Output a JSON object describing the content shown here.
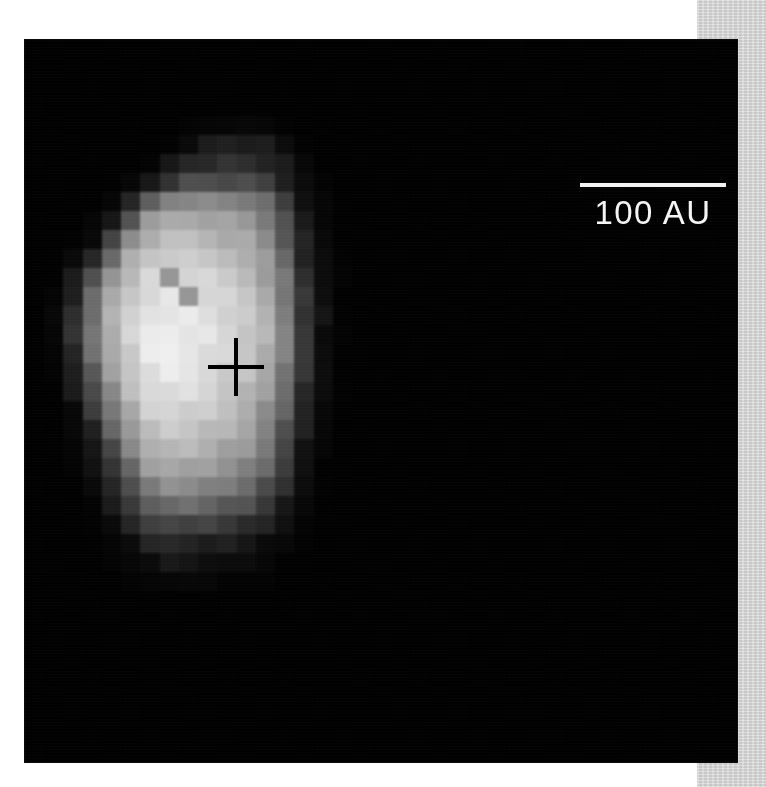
{
  "page": {
    "background_color": "#ffffff",
    "margin_strip_color": "#d4d4d4"
  },
  "image_panel": {
    "name": "astronomical-grayscale-image",
    "background_color": "#050505",
    "left": 25,
    "top": 40,
    "width": 712,
    "height": 722
  },
  "scale_bar": {
    "label": "100 AU",
    "value": 100,
    "unit": "AU",
    "line_color": "#f2f2f2",
    "text_color": "#f4f4f4",
    "line_length_px": 146
  },
  "position_marker": {
    "name": "source-position-cross",
    "color": "#000000",
    "center_x": 211,
    "center_y": 327,
    "arm_width_px": 56,
    "arm_height_px": 58
  },
  "chart_data": {
    "type": "heatmap",
    "title": "",
    "xlabel": "",
    "ylabel": "",
    "colormap": "grayscale",
    "vmin": 0,
    "vmax": 255,
    "cell_size_px": 19.2,
    "grid_cols": 37,
    "grid_rows": 38,
    "annotations": [
      {
        "kind": "scalebar",
        "text": "100 AU",
        "x": 626,
        "y": 185
      },
      {
        "kind": "cross",
        "text": "",
        "x": 211,
        "y": 327
      }
    ],
    "values": [
      [
        0,
        0,
        0,
        0,
        0,
        0,
        0,
        0,
        0,
        0,
        0,
        0,
        0,
        0,
        0,
        0,
        0,
        0,
        0,
        0,
        0,
        0,
        0,
        0,
        0,
        0,
        0,
        0,
        0,
        0,
        0,
        0,
        0,
        0,
        0,
        0,
        0
      ],
      [
        0,
        0,
        0,
        0,
        0,
        0,
        0,
        0,
        0,
        0,
        0,
        0,
        0,
        0,
        0,
        0,
        0,
        0,
        0,
        0,
        0,
        0,
        0,
        0,
        0,
        0,
        0,
        0,
        0,
        0,
        0,
        0,
        0,
        0,
        0,
        0,
        0
      ],
      [
        0,
        0,
        0,
        0,
        0,
        0,
        0,
        0,
        0,
        0,
        0,
        0,
        0,
        0,
        0,
        0,
        0,
        0,
        0,
        0,
        0,
        0,
        0,
        0,
        0,
        0,
        0,
        0,
        0,
        0,
        0,
        0,
        0,
        0,
        0,
        0,
        0
      ],
      [
        0,
        0,
        0,
        0,
        0,
        0,
        0,
        0,
        0,
        0,
        0,
        0,
        0,
        0,
        0,
        0,
        0,
        0,
        0,
        0,
        0,
        0,
        0,
        0,
        0,
        0,
        0,
        0,
        0,
        0,
        0,
        0,
        0,
        0,
        0,
        0,
        0
      ],
      [
        0,
        0,
        0,
        0,
        0,
        0,
        0,
        0,
        2,
        4,
        6,
        6,
        4,
        2,
        0,
        0,
        0,
        0,
        0,
        0,
        0,
        0,
        0,
        0,
        0,
        0,
        0,
        0,
        0,
        0,
        0,
        0,
        0,
        0,
        0,
        0,
        0
      ],
      [
        0,
        0,
        0,
        0,
        0,
        0,
        0,
        2,
        10,
        22,
        30,
        30,
        22,
        10,
        2,
        0,
        0,
        0,
        0,
        0,
        0,
        0,
        0,
        0,
        0,
        0,
        0,
        0,
        0,
        0,
        0,
        0,
        0,
        0,
        0,
        0,
        0
      ],
      [
        0,
        0,
        0,
        0,
        0,
        0,
        4,
        18,
        38,
        44,
        46,
        44,
        38,
        20,
        6,
        0,
        0,
        0,
        0,
        0,
        0,
        0,
        0,
        0,
        0,
        0,
        0,
        0,
        0,
        0,
        0,
        0,
        0,
        0,
        0,
        0,
        0
      ],
      [
        0,
        0,
        0,
        0,
        0,
        6,
        26,
        56,
        74,
        78,
        76,
        72,
        62,
        34,
        10,
        2,
        0,
        0,
        0,
        0,
        0,
        0,
        0,
        0,
        0,
        0,
        0,
        0,
        0,
        0,
        0,
        0,
        0,
        0,
        0,
        0,
        0
      ],
      [
        0,
        0,
        0,
        0,
        6,
        30,
        92,
        132,
        140,
        136,
        132,
        126,
        104,
        60,
        18,
        4,
        0,
        0,
        0,
        0,
        0,
        0,
        0,
        0,
        0,
        0,
        0,
        0,
        0,
        0,
        0,
        0,
        0,
        0,
        0,
        0,
        0
      ],
      [
        0,
        0,
        0,
        4,
        22,
        86,
        150,
        168,
        172,
        168,
        160,
        152,
        126,
        76,
        24,
        6,
        0,
        0,
        0,
        0,
        0,
        0,
        0,
        0,
        0,
        0,
        0,
        0,
        0,
        0,
        0,
        0,
        0,
        0,
        0,
        0,
        0
      ],
      [
        0,
        0,
        2,
        14,
        62,
        140,
        176,
        186,
        190,
        184,
        176,
        166,
        140,
        90,
        30,
        8,
        0,
        0,
        0,
        0,
        0,
        0,
        0,
        0,
        0,
        0,
        0,
        0,
        0,
        0,
        0,
        0,
        0,
        0,
        0,
        0,
        0
      ],
      [
        0,
        0,
        8,
        40,
        110,
        170,
        196,
        206,
        200,
        196,
        190,
        180,
        152,
        104,
        38,
        10,
        2,
        0,
        0,
        0,
        0,
        0,
        0,
        0,
        0,
        0,
        0,
        0,
        0,
        0,
        0,
        0,
        0,
        0,
        0,
        0,
        0
      ],
      [
        0,
        2,
        20,
        76,
        150,
        190,
        212,
        150,
        216,
        210,
        200,
        188,
        162,
        116,
        46,
        12,
        2,
        0,
        0,
        0,
        0,
        0,
        0,
        0,
        0,
        0,
        0,
        0,
        0,
        0,
        0,
        0,
        0,
        0,
        0,
        0,
        0
      ],
      [
        0,
        4,
        34,
        100,
        166,
        200,
        222,
        226,
        150,
        218,
        208,
        196,
        172,
        124,
        52,
        14,
        2,
        0,
        0,
        0,
        0,
        0,
        0,
        0,
        0,
        0,
        0,
        0,
        0,
        0,
        0,
        0,
        0,
        0,
        0,
        0,
        0
      ],
      [
        0,
        6,
        44,
        112,
        172,
        206,
        228,
        234,
        230,
        222,
        212,
        198,
        176,
        128,
        56,
        16,
        2,
        0,
        0,
        0,
        0,
        0,
        0,
        0,
        0,
        0,
        0,
        0,
        0,
        0,
        0,
        0,
        0,
        0,
        0,
        0,
        0
      ],
      [
        0,
        6,
        46,
        116,
        176,
        208,
        232,
        238,
        234,
        226,
        214,
        200,
        178,
        130,
        58,
        16,
        2,
        0,
        0,
        0,
        0,
        0,
        0,
        0,
        0,
        0,
        0,
        0,
        0,
        0,
        0,
        0,
        0,
        0,
        0,
        0,
        0
      ],
      [
        0,
        4,
        40,
        108,
        168,
        204,
        230,
        236,
        232,
        224,
        212,
        198,
        174,
        126,
        54,
        14,
        2,
        0,
        0,
        0,
        0,
        0,
        0,
        0,
        0,
        0,
        0,
        0,
        0,
        0,
        0,
        0,
        0,
        0,
        0,
        0,
        0
      ],
      [
        0,
        2,
        30,
        92,
        156,
        196,
        224,
        230,
        226,
        218,
        206,
        192,
        166,
        118,
        48,
        12,
        2,
        0,
        0,
        0,
        0,
        0,
        0,
        0,
        0,
        0,
        0,
        0,
        0,
        0,
        0,
        0,
        0,
        0,
        0,
        0,
        0
      ],
      [
        0,
        2,
        22,
        74,
        140,
        186,
        216,
        222,
        218,
        210,
        198,
        184,
        156,
        108,
        42,
        10,
        2,
        0,
        0,
        0,
        0,
        0,
        0,
        0,
        0,
        0,
        0,
        0,
        0,
        0,
        0,
        0,
        0,
        0,
        0,
        0,
        0
      ],
      [
        0,
        0,
        14,
        56,
        120,
        172,
        206,
        212,
        208,
        200,
        188,
        174,
        144,
        96,
        34,
        8,
        0,
        0,
        0,
        0,
        0,
        0,
        0,
        0,
        0,
        0,
        0,
        0,
        0,
        0,
        0,
        0,
        0,
        0,
        0,
        0,
        0
      ],
      [
        0,
        0,
        8,
        38,
        98,
        154,
        192,
        200,
        196,
        188,
        176,
        162,
        132,
        84,
        28,
        6,
        0,
        0,
        0,
        0,
        0,
        0,
        0,
        0,
        0,
        0,
        0,
        0,
        0,
        0,
        0,
        0,
        0,
        0,
        0,
        0,
        0
      ],
      [
        0,
        0,
        4,
        24,
        76,
        132,
        176,
        186,
        182,
        174,
        162,
        148,
        118,
        70,
        22,
        4,
        0,
        0,
        0,
        0,
        0,
        0,
        0,
        0,
        0,
        0,
        0,
        0,
        0,
        0,
        0,
        0,
        0,
        0,
        0,
        0,
        0
      ],
      [
        0,
        0,
        2,
        14,
        54,
        108,
        156,
        168,
        164,
        156,
        144,
        130,
        100,
        56,
        16,
        2,
        0,
        0,
        0,
        0,
        0,
        0,
        0,
        0,
        0,
        0,
        0,
        0,
        0,
        0,
        0,
        0,
        0,
        0,
        0,
        0,
        0
      ],
      [
        0,
        0,
        0,
        8,
        34,
        80,
        128,
        142,
        140,
        132,
        120,
        106,
        78,
        40,
        10,
        2,
        0,
        0,
        0,
        0,
        0,
        0,
        0,
        0,
        0,
        0,
        0,
        0,
        0,
        0,
        0,
        0,
        0,
        0,
        0,
        0,
        0
      ],
      [
        0,
        0,
        0,
        4,
        20,
        54,
        96,
        110,
        108,
        100,
        90,
        78,
        54,
        26,
        6,
        0,
        0,
        0,
        0,
        0,
        0,
        0,
        0,
        0,
        0,
        0,
        0,
        0,
        0,
        0,
        0,
        0,
        0,
        0,
        0,
        0,
        0
      ],
      [
        0,
        0,
        0,
        2,
        10,
        30,
        60,
        72,
        70,
        64,
        56,
        46,
        30,
        14,
        4,
        0,
        0,
        0,
        0,
        0,
        0,
        0,
        0,
        0,
        0,
        0,
        0,
        0,
        0,
        0,
        0,
        0,
        0,
        0,
        0,
        0,
        0
      ],
      [
        0,
        0,
        0,
        0,
        4,
        14,
        30,
        38,
        38,
        34,
        28,
        22,
        14,
        6,
        2,
        0,
        0,
        0,
        0,
        0,
        0,
        0,
        0,
        0,
        0,
        0,
        0,
        0,
        0,
        0,
        0,
        0,
        0,
        0,
        0,
        0,
        0
      ],
      [
        0,
        0,
        0,
        0,
        2,
        6,
        14,
        18,
        18,
        16,
        12,
        10,
        6,
        2,
        0,
        0,
        0,
        0,
        0,
        0,
        0,
        0,
        0,
        0,
        0,
        0,
        0,
        0,
        0,
        0,
        0,
        0,
        0,
        0,
        0,
        0,
        0
      ],
      [
        0,
        0,
        0,
        0,
        0,
        2,
        4,
        6,
        6,
        6,
        4,
        4,
        2,
        0,
        0,
        0,
        0,
        0,
        0,
        0,
        0,
        0,
        0,
        0,
        0,
        0,
        0,
        0,
        0,
        0,
        0,
        0,
        0,
        0,
        0,
        0,
        0
      ],
      [
        0,
        0,
        0,
        0,
        0,
        0,
        0,
        0,
        0,
        0,
        0,
        0,
        0,
        0,
        0,
        0,
        0,
        0,
        0,
        0,
        0,
        0,
        0,
        0,
        0,
        0,
        0,
        0,
        0,
        0,
        0,
        0,
        0,
        0,
        0,
        0,
        0
      ],
      [
        0,
        0,
        0,
        0,
        0,
        0,
        0,
        0,
        0,
        0,
        0,
        0,
        0,
        0,
        0,
        0,
        0,
        0,
        0,
        0,
        0,
        0,
        0,
        0,
        0,
        0,
        0,
        0,
        0,
        0,
        0,
        0,
        0,
        0,
        0,
        0,
        0
      ],
      [
        0,
        0,
        0,
        0,
        0,
        0,
        0,
        0,
        0,
        0,
        0,
        0,
        0,
        0,
        0,
        0,
        0,
        0,
        0,
        0,
        0,
        0,
        0,
        0,
        0,
        0,
        0,
        0,
        0,
        0,
        0,
        0,
        0,
        0,
        0,
        0,
        0
      ],
      [
        0,
        0,
        0,
        0,
        0,
        0,
        0,
        0,
        0,
        0,
        0,
        0,
        0,
        0,
        0,
        0,
        0,
        0,
        0,
        0,
        0,
        0,
        0,
        0,
        0,
        0,
        0,
        0,
        0,
        0,
        0,
        0,
        0,
        0,
        0,
        0,
        0
      ],
      [
        0,
        0,
        0,
        0,
        0,
        0,
        0,
        0,
        0,
        0,
        0,
        0,
        0,
        0,
        0,
        0,
        0,
        0,
        0,
        0,
        0,
        0,
        0,
        0,
        0,
        0,
        0,
        0,
        0,
        0,
        0,
        0,
        0,
        0,
        0,
        0,
        0
      ],
      [
        0,
        0,
        0,
        0,
        0,
        0,
        0,
        0,
        0,
        0,
        0,
        0,
        0,
        0,
        0,
        0,
        0,
        0,
        0,
        0,
        0,
        0,
        0,
        0,
        0,
        0,
        0,
        0,
        0,
        0,
        0,
        0,
        0,
        0,
        0,
        0,
        0
      ],
      [
        0,
        0,
        0,
        0,
        0,
        0,
        0,
        0,
        0,
        0,
        0,
        0,
        0,
        0,
        0,
        0,
        0,
        0,
        0,
        0,
        0,
        0,
        0,
        0,
        0,
        0,
        0,
        0,
        0,
        0,
        0,
        0,
        0,
        0,
        0,
        0,
        0
      ],
      [
        0,
        0,
        0,
        0,
        0,
        0,
        0,
        0,
        0,
        0,
        0,
        0,
        0,
        0,
        0,
        0,
        0,
        0,
        0,
        0,
        0,
        0,
        0,
        0,
        0,
        0,
        0,
        0,
        0,
        0,
        0,
        0,
        0,
        0,
        0,
        0,
        0
      ],
      [
        0,
        0,
        0,
        0,
        0,
        0,
        0,
        0,
        0,
        0,
        0,
        0,
        0,
        0,
        0,
        0,
        0,
        0,
        0,
        0,
        0,
        0,
        0,
        0,
        0,
        0,
        0,
        0,
        0,
        0,
        0,
        0,
        0,
        0,
        0,
        0,
        0
      ]
    ]
  }
}
